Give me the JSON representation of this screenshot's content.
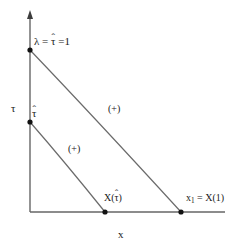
{
  "figure": {
    "background_color": "#ffffff",
    "line_color": "#4d4d4d",
    "text_color": "#1a1a1a",
    "axes": {
      "x_label": "x",
      "y_label": "τ",
      "origin": [
        30,
        212
      ],
      "x_end": [
        225,
        212
      ],
      "y_end": [
        30,
        12
      ]
    },
    "labels": {
      "top_point": {
        "lambda": "λ",
        "eq1": "=",
        "tau": "τ",
        "hat": "ˆ",
        "eq2": "=1",
        "full_text": "λ = τ̂ =1"
      },
      "tau_hat_point": {
        "tau": "τ",
        "hat": "ˆ",
        "full_text": "τ̂"
      },
      "x_tau_hat": {
        "prefix": "X(",
        "tau": "τ",
        "hat": "ˆ",
        "suffix": ")",
        "full_text": "X(τ̂)"
      },
      "x_one": {
        "symbol": "x",
        "subscript": "1",
        "rest": " = X(1)",
        "full_text": "x₁ = X(1)"
      },
      "sign_upper": "(+)",
      "sign_lower": "(+)"
    },
    "curves": [
      {
        "name": "upper-characteristic",
        "start_label": "λ = τ̂ =1",
        "start_point": [
          30,
          50
        ],
        "end_label": "x₁ = X(1)",
        "end_point": [
          181,
          212
        ],
        "sign": "(+)",
        "shape": "convex-decreasing"
      },
      {
        "name": "lower-characteristic",
        "start_label": "τ̂",
        "start_point": [
          30,
          122
        ],
        "end_label": "X(τ̂)",
        "end_point": [
          105,
          212
        ],
        "sign": "(+)",
        "shape": "convex-decreasing"
      }
    ],
    "markers": [
      {
        "name": "marker-lambda-tau-one",
        "point": [
          30,
          50
        ]
      },
      {
        "name": "marker-tau-hat",
        "point": [
          30,
          122
        ]
      },
      {
        "name": "marker-x-tau-hat",
        "point": [
          105,
          212
        ]
      },
      {
        "name": "marker-x-one",
        "point": [
          181,
          212
        ]
      }
    ]
  }
}
